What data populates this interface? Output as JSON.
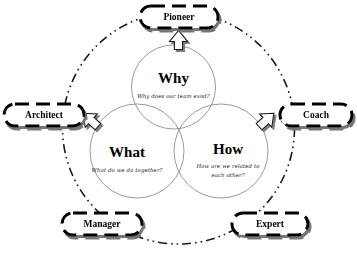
{
  "diagram": {
    "type": "venn-3-circle-with-roles",
    "colors": {
      "circle_stroke": "#8a8a8a",
      "ring_stroke": "#1a1a1a",
      "box_stroke": "#000000",
      "box_fill": "#ffffff",
      "shadow": "#6e6e6e",
      "text": "#000000",
      "arrow_fill": "#ffffff",
      "arrow_stroke": "#1a1a1a"
    },
    "circles": [
      {
        "id": "why",
        "title": "Why",
        "question": "Why does our team exist?",
        "position": "top"
      },
      {
        "id": "what",
        "title": "What",
        "question": "What do we do together?",
        "position": "bottom-left"
      },
      {
        "id": "how",
        "title": "How",
        "question_line1": "How are we related to",
        "question_line2": "each other?",
        "position": "bottom-right"
      }
    ],
    "roles": [
      {
        "id": "pioneer",
        "label": "Pioneer",
        "position": "top"
      },
      {
        "id": "architect",
        "label": "Architect",
        "position": "left"
      },
      {
        "id": "coach",
        "label": "Coach",
        "position": "right"
      },
      {
        "id": "manager",
        "label": "Manager",
        "position": "bottom-left"
      },
      {
        "id": "expert",
        "label": "Expert",
        "position": "bottom-right"
      }
    ],
    "roles_extra": [
      {
        "id": "expert2",
        "label": "Expert",
        "position": "bottom-right"
      }
    ],
    "arrows": [
      {
        "id": "arrow-to-pioneer",
        "points_to": "Pioneer",
        "direction": "up"
      },
      {
        "id": "arrow-to-architect",
        "points_to": "Architect",
        "direction": "up-left"
      },
      {
        "id": "arrow-to-coach",
        "points_to": "Coach",
        "direction": "up-right"
      }
    ]
  }
}
